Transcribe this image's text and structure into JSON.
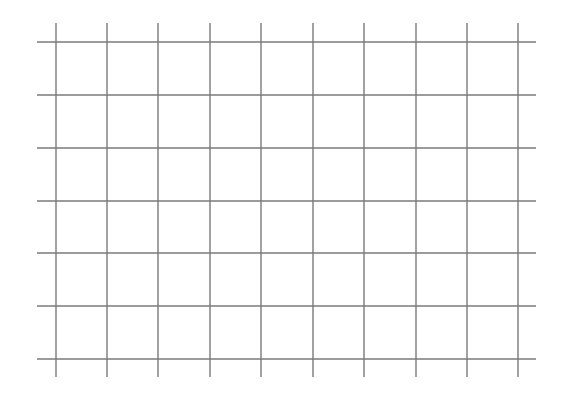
{
  "canvas": {
    "width": 571,
    "height": 404,
    "background": "#ffffff"
  },
  "grid": {
    "line_color": "#7a7a7a",
    "line_width": 1.4,
    "horizontal_lines": {
      "y": [
        42,
        95,
        148,
        201,
        253,
        306,
        359
      ],
      "x_start": 37,
      "x_end": 536
    },
    "vertical_lines": {
      "x": [
        56,
        107,
        158,
        210,
        261,
        313,
        364,
        416,
        467,
        518
      ],
      "y_start": 23,
      "y_end": 377
    },
    "rows": 6,
    "columns": 9
  }
}
